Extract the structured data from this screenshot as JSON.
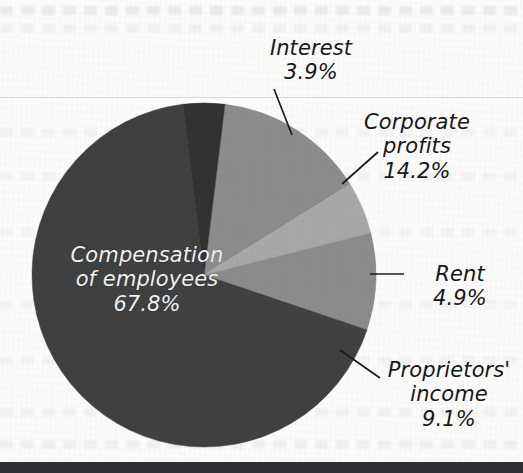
{
  "figure": {
    "background_color": "#fbfbfa",
    "rule_color": "#d9d9d9",
    "bottom_band_color": "#2f3033"
  },
  "chart_data": {
    "type": "pie",
    "title": "",
    "subtitle": "",
    "xlabel": "",
    "ylabel": "",
    "legend_position": "none",
    "labels_position": "callout",
    "units": "percent",
    "total": 99.9,
    "categories": [
      "Compensation of employees",
      "Corporate profits",
      "Proprietors' income",
      "Rent",
      "Interest"
    ],
    "values": [
      67.8,
      14.2,
      9.1,
      4.9,
      3.9
    ],
    "value_labels": [
      "67.8%",
      "14.2%",
      "9.1%",
      "4.9%",
      "3.9%"
    ],
    "colors": [
      "#3f4042",
      "#8b8c8e",
      "#8b8c8e",
      "#a7a8aa",
      "#313234"
    ],
    "slices": [
      {
        "name": "Compensation of employees",
        "value": 67.8,
        "value_label": "67.8%",
        "color": "#3f4042",
        "label_inside": true,
        "label_lines": [
          "Compensation",
          "of employees",
          "67.8%"
        ]
      },
      {
        "name": "Corporate profits",
        "value": 14.2,
        "value_label": "14.2%",
        "color": "#8b8c8e",
        "label_inside": false,
        "label_lines": [
          "Corporate",
          "profits",
          "14.2%"
        ]
      },
      {
        "name": "Proprietors' income",
        "value": 9.1,
        "value_label": "9.1%",
        "color": "#8b8c8e",
        "label_inside": false,
        "label_lines": [
          "Proprietors'",
          "income",
          "9.1%"
        ]
      },
      {
        "name": "Rent",
        "value": 4.9,
        "value_label": "4.9%",
        "color": "#a7a8aa",
        "label_inside": false,
        "label_lines": [
          "Rent",
          "4.9%"
        ]
      },
      {
        "name": "Interest",
        "value": 3.9,
        "value_label": "3.9%",
        "color": "#313234",
        "label_inside": false,
        "label_lines": [
          "Interest",
          "3.9%"
        ]
      }
    ]
  },
  "labels": {
    "interest": {
      "name": "Interest",
      "value": "3.9%"
    },
    "corporate_profits": {
      "name_line1": "Corporate",
      "name_line2": "profits",
      "value": "14.2%"
    },
    "rent": {
      "name": "Rent",
      "value": "4.9%"
    },
    "proprietors_income": {
      "name_line1": "Proprietors'",
      "name_line2": "income",
      "value": "9.1%"
    },
    "compensation": {
      "name_line1": "Compensation",
      "name_line2": "of employees",
      "value": "67.8%"
    }
  }
}
